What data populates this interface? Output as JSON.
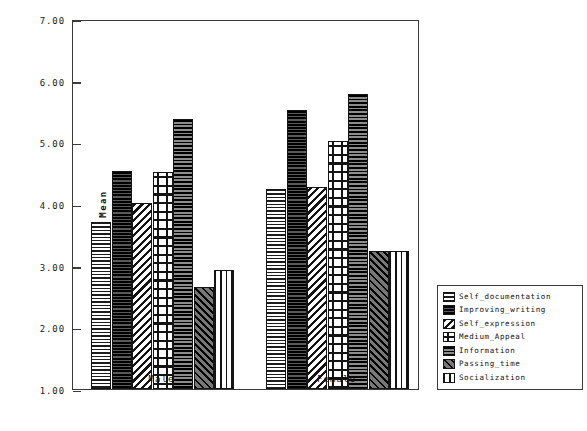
{
  "chart_data": {
    "type": "bar",
    "title": "",
    "xlabel": "",
    "ylabel": "Mean",
    "categories": [
      "Male",
      "Female"
    ],
    "ylim": [
      1.0,
      7.0
    ],
    "yticks": [
      "1.00",
      "2.00",
      "3.00",
      "4.00",
      "5.00",
      "6.00",
      "7.00"
    ],
    "ytick_values": [
      1.0,
      2.0,
      3.0,
      4.0,
      5.0,
      6.0,
      7.0
    ],
    "grid": false,
    "legend_position": "right",
    "series": [
      {
        "name": "Self_documentation",
        "values": [
          3.71,
          4.24
        ]
      },
      {
        "name": "Improving_writing",
        "values": [
          4.53,
          5.52
        ]
      },
      {
        "name": "Self_expression",
        "values": [
          4.02,
          4.28
        ]
      },
      {
        "name": "Medium_Appeal",
        "values": [
          4.52,
          5.02
        ]
      },
      {
        "name": "Information",
        "values": [
          5.38,
          5.79
        ]
      },
      {
        "name": "Passing_time",
        "values": [
          2.66,
          3.24
        ]
      },
      {
        "name": "Socialization",
        "values": [
          2.93,
          3.24
        ]
      }
    ]
  },
  "legend": {
    "items": [
      "Self_documentation",
      "Improving_writing",
      "Self_expression",
      "Medium_Appeal",
      "Information",
      "Passing_time",
      "Socialization"
    ]
  },
  "axis": {
    "y_title": "Mean",
    "x_categories": [
      "Male",
      "Female"
    ]
  }
}
